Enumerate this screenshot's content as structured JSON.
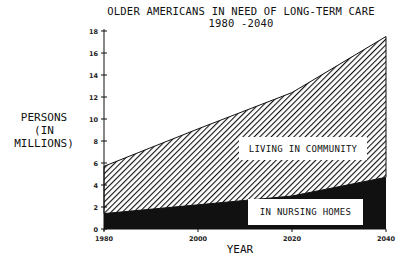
{
  "chart_data": {
    "type": "area",
    "stacked": true,
    "title": "OLDER AMERICANS IN NEED OF LONG-TERM CARE",
    "subtitle": "1980 -2040",
    "xlabel": "YEAR",
    "ylabel": "PERSONS (IN MILLIONS)",
    "ylabel_lines": [
      "PERSONS",
      "(IN MILLIONS)"
    ],
    "x": [
      1980,
      2000,
      2020,
      2040
    ],
    "x_ticks": [
      "1980",
      "2000",
      "2020",
      "2040"
    ],
    "y_ticks": [
      "0",
      "2",
      "4",
      "6",
      "8",
      "10",
      "12",
      "14",
      "16",
      "18"
    ],
    "ylim": [
      0,
      18
    ],
    "grid": false,
    "series": [
      {
        "name": "IN NURSING HOMES",
        "values": [
          1.4,
          2.2,
          3.0,
          4.7
        ],
        "fill": "solid-black"
      },
      {
        "name": "LIVING IN COMMUNITY",
        "values": [
          4.3,
          6.9,
          9.4,
          12.8
        ],
        "fill": "diagonal-hatch"
      }
    ],
    "totals": [
      5.7,
      9.1,
      12.4,
      17.5
    ],
    "annotations": [
      "LIVING IN COMMUNITY",
      "IN NURSING HOMES"
    ]
  },
  "colors": {
    "ink": "#111111",
    "background": "#ffffff"
  }
}
